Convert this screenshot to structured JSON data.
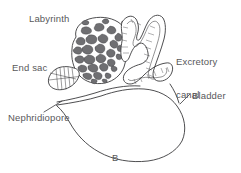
{
  "figure": {
    "panel_caption": "B",
    "background_color": "#ffffff",
    "ink_color": "#3a3a3c",
    "text_color": "#58585a",
    "fill_color": "#6f6f72",
    "width": 241,
    "height": 173
  },
  "labels": {
    "labyrinth": "Labyrinth",
    "excretory_canal_line1": "Excretory",
    "excretory_canal_line2": "canal",
    "end_sac": "End sac",
    "bladder": "Bladder",
    "nephridiopore": "Nephridiopore"
  },
  "structures": [
    {
      "name": "labyrinth",
      "description": "rounded mass of coiled tubules with dark irregular blobs"
    },
    {
      "name": "end-sac",
      "description": "small fan shaped sac with radiating striations at left"
    },
    {
      "name": "excretory-canal",
      "description": "folded double walled tube with internal cross striations"
    },
    {
      "name": "bladder",
      "description": "large smooth empty oval sac"
    },
    {
      "name": "nephridiopore",
      "description": "narrow duct opening at left tip of bladder"
    }
  ]
}
